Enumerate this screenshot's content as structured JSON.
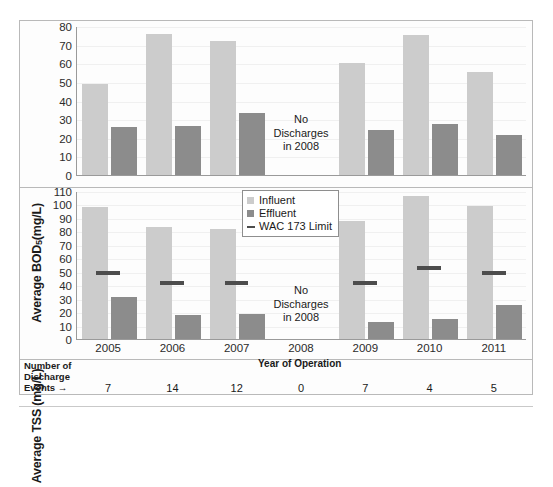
{
  "chart_data": [
    {
      "type": "bar",
      "title": "",
      "ylabel": "Average BOD₅ (mg/L)",
      "xlabel": "",
      "categories": [
        "2005",
        "2006",
        "2007",
        "2008",
        "2009",
        "2010",
        "2011"
      ],
      "ylim": [
        0,
        80
      ],
      "ytick_step": 10,
      "yticks": [
        "80",
        "70",
        "60",
        "50",
        "40",
        "30",
        "20",
        "10",
        "0"
      ],
      "grid": true,
      "legend_position": "none",
      "series": [
        {
          "name": "Influent",
          "color": "#cccccc",
          "values": [
            49,
            75.5,
            72,
            null,
            60,
            75,
            55.5
          ]
        },
        {
          "name": "Effluent",
          "color": "#8c8c8c",
          "values": [
            26,
            26.5,
            33.5,
            null,
            24,
            27.5,
            21.5
          ]
        }
      ],
      "annotations": [
        {
          "text": "No Discharges in 2008",
          "lines": [
            "No",
            "Discharges",
            "in 2008"
          ],
          "at_category": "2008"
        }
      ]
    },
    {
      "type": "bar",
      "title": "",
      "ylabel": "Average TSS (mg/L)",
      "xlabel": "Year of Operation",
      "categories": [
        "2005",
        "2006",
        "2007",
        "2008",
        "2009",
        "2010",
        "2011"
      ],
      "ylim": [
        0,
        110
      ],
      "ytick_step": 10,
      "yticks": [
        "110",
        "100",
        "90",
        "80",
        "70",
        "60",
        "50",
        "40",
        "30",
        "20",
        "10",
        "0"
      ],
      "grid": true,
      "legend_position": "top-right",
      "series": [
        {
          "name": "Influent",
          "color": "#cccccc",
          "values": [
            98,
            83,
            81.5,
            null,
            88,
            106,
            99
          ]
        },
        {
          "name": "Effluent",
          "color": "#8c8c8c",
          "values": [
            31,
            18,
            18.5,
            null,
            13,
            15,
            25
          ]
        },
        {
          "name": "WAC 173 Limit",
          "color": "#4d4d4d",
          "values": [
            49,
            42,
            41.5,
            null,
            42,
            53,
            49
          ]
        }
      ],
      "annotations": [
        {
          "text": "No Discharges in 2008",
          "lines": [
            "No",
            "Discharges",
            "in 2008"
          ],
          "at_category": "2008"
        }
      ]
    }
  ],
  "bod_panel": {
    "ylabel_main": "Average BOD",
    "ylabel_sub": "5",
    "ylabel_unit": " (mg/L)",
    "yticks": [
      "80",
      "70",
      "60",
      "50",
      "40",
      "30",
      "20",
      "10",
      "0"
    ],
    "note_line1": "No",
    "note_line2": "Discharges",
    "note_line3": "in 2008"
  },
  "tss_panel": {
    "ylabel": "Average TSS (mg/L)",
    "yticks": [
      "110",
      "100",
      "90",
      "80",
      "70",
      "60",
      "50",
      "40",
      "30",
      "20",
      "10",
      "0"
    ],
    "note_line1": "No",
    "note_line2": "Discharges",
    "note_line3": "in 2008"
  },
  "legend": {
    "influent": "Influent",
    "effluent": "Effluent",
    "limit": "WAC 173 Limit"
  },
  "axis": {
    "years": [
      "2005",
      "2006",
      "2007",
      "2008",
      "2009",
      "2010",
      "2011"
    ],
    "xtitle": "Year of Operation"
  },
  "events": {
    "label_line1": "Number of",
    "label_line2": "Discharge",
    "label_line3": "Events →",
    "values": [
      "7",
      "14",
      "12",
      "0",
      "7",
      "4",
      "5"
    ]
  },
  "colors": {
    "influent": "#cccccc",
    "effluent": "#8c8c8c",
    "limit": "#4d4d4d",
    "frame": "#b9b9b9",
    "axis": "#9a9a9a",
    "grid": "#f0f0f0",
    "text": "#1a1a1a",
    "background": "#ffffff"
  }
}
